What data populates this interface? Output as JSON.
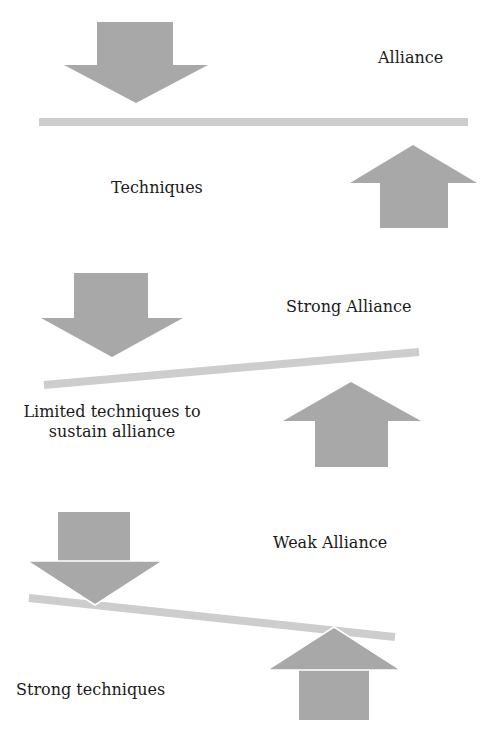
{
  "colors": {
    "arrow": "#a8a8a8",
    "beam": "#cdcdcd",
    "text": "#1a1a1a",
    "background": "#ffffff"
  },
  "panels": [
    {
      "id": "balanced",
      "top_label": "Alliance",
      "bottom_label": "Techniques",
      "beam": {
        "x1": 39,
        "y1": 122,
        "x2": 468,
        "y2": 122
      },
      "down_arrow": {
        "shaft": [
          97,
          22,
          173,
          65
        ],
        "head": [
          [
            64,
            65
          ],
          [
            208,
            65
          ],
          [
            136,
            103
          ]
        ]
      },
      "up_arrow": {
        "shaft": [
          380,
          183,
          448,
          228
        ],
        "head": [
          [
            350,
            183
          ],
          [
            477,
            183
          ],
          [
            413,
            145
          ]
        ]
      }
    },
    {
      "id": "strong-alliance",
      "top_label": "Strong Alliance",
      "bottom_label_line1": "Limited techniques to",
      "bottom_label_line2": "sustain alliance",
      "beam": {
        "x1": 44,
        "y1": 385,
        "x2": 419,
        "y2": 352
      },
      "down_arrow": {
        "shaft": [
          74,
          273,
          148,
          318
        ],
        "head": [
          [
            41,
            318
          ],
          [
            183,
            318
          ],
          [
            112,
            357
          ]
        ]
      },
      "up_arrow": {
        "shaft": [
          315,
          421,
          388,
          467
        ],
        "head": [
          [
            283,
            421
          ],
          [
            421,
            421
          ],
          [
            351,
            382
          ]
        ]
      }
    },
    {
      "id": "weak-alliance",
      "top_label": "Weak Alliance",
      "bottom_label": "Strong techniques",
      "beam": {
        "x1": 29,
        "y1": 598,
        "x2": 395,
        "y2": 637
      },
      "down_arrow": {
        "shaft": [
          58,
          512,
          130,
          561
        ],
        "head": [
          [
            27,
            561
          ],
          [
            163,
            561
          ],
          [
            95,
            605
          ]
        ]
      },
      "up_arrow": {
        "shaft": [
          299,
          670,
          369,
          720
        ],
        "head": [
          [
            267,
            670
          ],
          [
            401,
            670
          ],
          [
            334,
            627
          ]
        ]
      }
    }
  ]
}
